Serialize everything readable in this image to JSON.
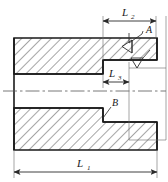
{
  "drawing": {
    "type": "engineering-section-view",
    "description": "Cross-sectional technical drawing of a stepped cylindrical sleeve / bushing with a counterbored through hole",
    "colors": {
      "outline": "#1a1a1a",
      "hatch": "#3a3a3a",
      "dimension": "#2a2a2a",
      "centerline": "#555555",
      "background": "#ffffff"
    },
    "dimensions": [
      {
        "id": "L1",
        "name": "overall-length",
        "base": "L",
        "subscript": "1",
        "position": "bottom",
        "label_x": 84,
        "label_y": 166,
        "line_y": 172,
        "from_x": 14,
        "to_x": 157
      },
      {
        "id": "L2",
        "name": "counterbore-depth",
        "base": "L",
        "subscript": "2",
        "position": "top",
        "label_x": 129,
        "label_y": 14,
        "line_y": 21,
        "from_x": 103,
        "to_x": 156
      },
      {
        "id": "L3",
        "name": "step-width",
        "base": "L",
        "subscript": "3",
        "position": "middle",
        "label_x": 113,
        "label_y": 73,
        "line_y": 82,
        "from_x": 103,
        "to_x": 129
      }
    ],
    "callouts": [
      {
        "id": "A",
        "name": "detail-callout-a",
        "label": "A",
        "label_x": 147,
        "label_y": 32,
        "leader_from_x": 143,
        "leader_from_y": 34,
        "leader_to_x": 128,
        "leader_to_y": 44
      },
      {
        "id": "B",
        "name": "detail-callout-b",
        "label": "B",
        "label_x": 113,
        "label_y": 105,
        "leader_from_x": 111,
        "leader_from_y": 107,
        "leader_to_x": 103,
        "leader_to_y": 117
      }
    ],
    "surface_symbols": [
      {
        "id": "surf-1",
        "name": "surface-roughness-symbol-upper",
        "x": 128,
        "y": 44,
        "rotation": -90,
        "size": 11
      },
      {
        "id": "surf-2",
        "name": "surface-roughness-symbol-lower",
        "x": 137,
        "y": 62,
        "rotation": 0,
        "size": 11
      }
    ],
    "geometry": {
      "body_left": 14,
      "body_right": 157,
      "body_top": 38,
      "body_bottom": 150,
      "bore_top": 74,
      "bore_bottom": 108,
      "step_x": 103,
      "counterbore_top": 60,
      "counterbore_bottom": 122,
      "centerline_y": 91
    },
    "centerline": {
      "name": "axis-centerline",
      "y": 91,
      "from_x": 3,
      "to_x": 166
    }
  }
}
